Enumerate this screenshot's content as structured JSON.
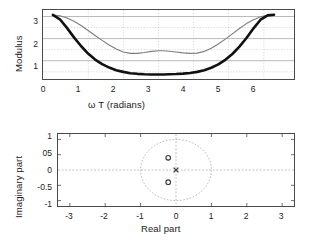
{
  "figure": {
    "background": "#ffffff",
    "ink": "#111111",
    "gray": "#7d7d7d"
  },
  "chart_data": [
    {
      "id": "modulus-plot",
      "type": "line",
      "title": "",
      "xlabel": "ω T  (radians)",
      "ylabel": "Modulus",
      "xlim": [
        -0.28,
        6.85
      ],
      "ylim": [
        0.35,
        3.55
      ],
      "xticks": [
        0,
        1,
        2,
        3,
        4,
        5,
        6
      ],
      "xticklabels": [
        "0",
        "1",
        "2",
        "3",
        "4",
        "5",
        "6"
      ],
      "yticks": [
        1,
        2,
        3
      ],
      "yticklabels": [
        "1",
        "2",
        "3"
      ],
      "y_minor_gridlines": [
        1.5,
        2.5,
        3.5
      ],
      "grid": true,
      "legend": "none",
      "series": [
        {
          "name": "upper-modulus",
          "style": "thin-gray",
          "color": "#7d7d7d",
          "x": [
            0.0,
            0.2,
            0.4,
            0.6,
            0.8,
            1.0,
            1.2,
            1.4,
            1.6,
            1.8,
            2.0,
            2.2,
            2.4,
            2.6,
            2.8,
            3.0,
            3.1416,
            3.3,
            3.5,
            3.7,
            3.9,
            4.1,
            4.3,
            4.5,
            4.7,
            4.9,
            5.1,
            5.3,
            5.5,
            5.7,
            5.9,
            6.1,
            6.2832
          ],
          "y": [
            3.32,
            3.28,
            3.18,
            3.03,
            2.83,
            2.6,
            2.37,
            2.14,
            1.93,
            1.74,
            1.6,
            1.54,
            1.54,
            1.58,
            1.63,
            1.66,
            1.66,
            1.64,
            1.6,
            1.56,
            1.54,
            1.55,
            1.63,
            1.78,
            1.97,
            2.2,
            2.44,
            2.69,
            2.92,
            3.1,
            3.24,
            3.31,
            3.33
          ]
        },
        {
          "name": "lower-modulus",
          "style": "thick-black",
          "color": "#111111",
          "x": [
            0.0,
            0.2,
            0.4,
            0.6,
            0.8,
            1.0,
            1.2,
            1.4,
            1.6,
            1.8,
            2.0,
            2.2,
            2.4,
            2.6,
            2.8,
            3.0,
            3.1416,
            3.3,
            3.5,
            3.7,
            3.9,
            4.1,
            4.3,
            4.5,
            4.7,
            4.9,
            5.1,
            5.3,
            5.5,
            5.7,
            5.9,
            6.1,
            6.2832
          ],
          "y": [
            3.32,
            3.12,
            2.72,
            2.28,
            1.88,
            1.53,
            1.25,
            1.04,
            0.88,
            0.76,
            0.68,
            0.62,
            0.59,
            0.57,
            0.56,
            0.56,
            0.56,
            0.57,
            0.58,
            0.6,
            0.63,
            0.68,
            0.76,
            0.87,
            1.03,
            1.24,
            1.51,
            1.85,
            2.25,
            2.7,
            3.1,
            3.3,
            3.33
          ]
        }
      ]
    },
    {
      "id": "pole-zero-plot",
      "type": "scatter",
      "title": "",
      "xlabel": "Real part",
      "ylabel": "Imaginary part",
      "xlim": [
        -3.35,
        3.35
      ],
      "ylim": [
        -1.18,
        1.18
      ],
      "xticks": [
        -3,
        -2,
        -1,
        0,
        1,
        2,
        3
      ],
      "xticklabels": [
        "-3",
        "-2",
        "-1",
        "0",
        "1",
        "2",
        "3"
      ],
      "yticks": [
        1,
        0.5,
        0,
        -0.5,
        -1
      ],
      "yticklabels": [
        "1",
        "05",
        "0",
        "-0.5",
        "-1"
      ],
      "grid": false,
      "legend": "none",
      "annotations": [
        "unit circle (dashed) centred on origin, radius 1"
      ],
      "series": [
        {
          "name": "zeros",
          "marker": "o",
          "color": "#3a3a3a",
          "points": [
            [
              -0.22,
              0.4
            ],
            [
              -0.22,
              -0.4
            ]
          ]
        },
        {
          "name": "poles",
          "marker": "x",
          "color": "#3a3a3a",
          "points": [
            [
              0.0,
              0.0
            ]
          ]
        }
      ]
    }
  ]
}
